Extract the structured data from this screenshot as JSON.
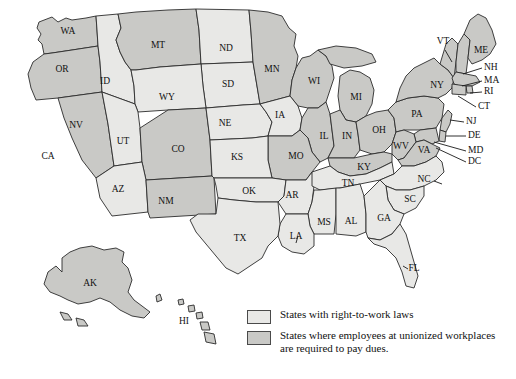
{
  "map": {
    "title": "",
    "colors": {
      "right_to_work": "#e8e8e6",
      "union_dues": "#c9c9c6",
      "border": "#2b2b2b",
      "background": "#ffffff"
    },
    "states": [
      {
        "abbr": "WA",
        "category": "union_dues",
        "label_x": 68,
        "label_y": 32
      },
      {
        "abbr": "OR",
        "category": "union_dues",
        "label_x": 62,
        "label_y": 70
      },
      {
        "abbr": "ID",
        "category": "right_to_work",
        "label_x": 105,
        "label_y": 82
      },
      {
        "abbr": "MT",
        "category": "union_dues",
        "label_x": 158,
        "label_y": 46
      },
      {
        "abbr": "ND",
        "category": "right_to_work",
        "label_x": 226,
        "label_y": 49
      },
      {
        "abbr": "SD",
        "category": "right_to_work",
        "label_x": 228,
        "label_y": 85
      },
      {
        "abbr": "MN",
        "category": "union_dues",
        "label_x": 272,
        "label_y": 70
      },
      {
        "abbr": "WI",
        "category": "union_dues",
        "label_x": 314,
        "label_y": 82
      },
      {
        "abbr": "MI",
        "category": "union_dues",
        "label_x": 356,
        "label_y": 98
      },
      {
        "abbr": "WY",
        "category": "right_to_work",
        "label_x": 167,
        "label_y": 98
      },
      {
        "abbr": "NV",
        "category": "union_dues",
        "label_x": 76,
        "label_y": 126
      },
      {
        "abbr": "UT",
        "category": "right_to_work",
        "label_x": 123,
        "label_y": 142
      },
      {
        "abbr": "CO",
        "category": "union_dues",
        "label_x": 178,
        "label_y": 150
      },
      {
        "abbr": "NE",
        "category": "right_to_work",
        "label_x": 225,
        "label_y": 124
      },
      {
        "abbr": "IA",
        "category": "right_to_work",
        "label_x": 280,
        "label_y": 116
      },
      {
        "abbr": "IL",
        "category": "union_dues",
        "label_x": 324,
        "label_y": 137
      },
      {
        "abbr": "IN",
        "category": "union_dues",
        "label_x": 347,
        "label_y": 137
      },
      {
        "abbr": "OH",
        "category": "union_dues",
        "label_x": 379,
        "label_y": 131
      },
      {
        "abbr": "PA",
        "category": "union_dues",
        "label_x": 417,
        "label_y": 115
      },
      {
        "abbr": "CA",
        "category": "union_dues",
        "label_x": 48,
        "label_y": 157
      },
      {
        "abbr": "AZ",
        "category": "right_to_work",
        "label_x": 118,
        "label_y": 190
      },
      {
        "abbr": "NM",
        "category": "union_dues",
        "label_x": 166,
        "label_y": 202
      },
      {
        "abbr": "KS",
        "category": "right_to_work",
        "label_x": 237,
        "label_y": 158
      },
      {
        "abbr": "MO",
        "category": "union_dues",
        "label_x": 296,
        "label_y": 157
      },
      {
        "abbr": "KY",
        "category": "union_dues",
        "label_x": 364,
        "label_y": 168
      },
      {
        "abbr": "WV",
        "category": "union_dues",
        "label_x": 401,
        "label_y": 147
      },
      {
        "abbr": "VA",
        "category": "union_dues",
        "label_x": 424,
        "label_y": 151
      },
      {
        "abbr": "OK",
        "category": "right_to_work",
        "label_x": 249,
        "label_y": 192
      },
      {
        "abbr": "AR",
        "category": "right_to_work",
        "label_x": 292,
        "label_y": 196
      },
      {
        "abbr": "TN",
        "category": "right_to_work",
        "label_x": 348,
        "label_y": 184
      },
      {
        "abbr": "NC",
        "category": "right_to_work",
        "label_x": 424,
        "label_y": 180
      },
      {
        "abbr": "SC",
        "category": "right_to_work",
        "label_x": 410,
        "label_y": 200
      },
      {
        "abbr": "MS",
        "category": "right_to_work",
        "label_x": 324,
        "label_y": 223
      },
      {
        "abbr": "AL",
        "category": "right_to_work",
        "label_x": 351,
        "label_y": 222
      },
      {
        "abbr": "GA",
        "category": "right_to_work",
        "label_x": 384,
        "label_y": 219
      },
      {
        "abbr": "LA",
        "category": "right_to_work",
        "label_x": 296,
        "label_y": 237
      },
      {
        "abbr": "TX",
        "category": "right_to_work",
        "label_x": 240,
        "label_y": 239
      },
      {
        "abbr": "FL",
        "category": "right_to_work",
        "label_x": 414,
        "label_y": 269
      },
      {
        "abbr": "AK",
        "category": "union_dues",
        "label_x": 90,
        "label_y": 284
      },
      {
        "abbr": "HI",
        "category": "union_dues",
        "label_x": 184,
        "label_y": 322
      },
      {
        "abbr": "NY",
        "category": "union_dues",
        "label_x": 437,
        "label_y": 86
      },
      {
        "abbr": "VT",
        "category": "union_dues",
        "label_x": 443,
        "label_y": 42
      },
      {
        "abbr": "ME",
        "category": "union_dues",
        "label_x": 481,
        "label_y": 51
      }
    ],
    "callouts": [
      {
        "abbr": "NH",
        "category": "union_dues",
        "text_x": 484,
        "text_y": 68,
        "line": [
          [
            482,
            68
          ],
          [
            463,
            74
          ]
        ]
      },
      {
        "abbr": "MA",
        "category": "union_dues",
        "text_x": 484,
        "text_y": 81,
        "line": [
          [
            482,
            81
          ],
          [
            462,
            86
          ]
        ]
      },
      {
        "abbr": "RI",
        "category": "union_dues",
        "text_x": 484,
        "text_y": 92,
        "line": [
          [
            482,
            92
          ],
          [
            463,
            95
          ]
        ]
      },
      {
        "abbr": "CT",
        "category": "union_dues",
        "text_x": 478,
        "text_y": 107,
        "line": [
          [
            476,
            107
          ],
          [
            457,
            100
          ]
        ]
      },
      {
        "abbr": "NJ",
        "category": "union_dues",
        "text_x": 466,
        "text_y": 122,
        "line": [
          [
            464,
            122
          ],
          [
            447,
            117
          ]
        ]
      },
      {
        "abbr": "DE",
        "category": "union_dues",
        "text_x": 468,
        "text_y": 136,
        "line": [
          [
            466,
            136
          ],
          [
            444,
            130
          ]
        ]
      },
      {
        "abbr": "MD",
        "category": "union_dues",
        "text_x": 468,
        "text_y": 151,
        "line": [
          [
            466,
            151
          ],
          [
            437,
            139
          ]
        ]
      },
      {
        "abbr": "DC",
        "category": "union_dues",
        "text_x": 468,
        "text_y": 162,
        "line": [
          [
            466,
            162
          ],
          [
            437,
            147
          ]
        ]
      }
    ]
  },
  "legend": {
    "entries": [
      {
        "swatch": "right_to_work",
        "text": "States with right-to-work laws"
      },
      {
        "swatch": "union_dues",
        "text": "States where employees at unionized workplaces are required to pay dues."
      }
    ]
  }
}
